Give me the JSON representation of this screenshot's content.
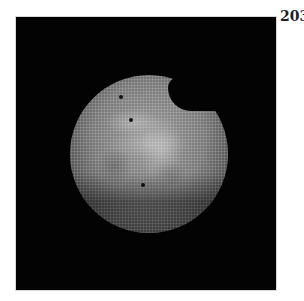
{
  "figure": {
    "panel_label": "203",
    "image": {
      "description": "Grayscale micrograph of a circular bright disk with hexagonal dot texture on black background",
      "background_color": "#030303",
      "disk_color": "#8a8a8a",
      "marker_dots": [
        {
          "x": 121,
          "y": 97
        },
        {
          "x": 131,
          "y": 120
        },
        {
          "x": 143,
          "y": 185
        }
      ]
    }
  }
}
